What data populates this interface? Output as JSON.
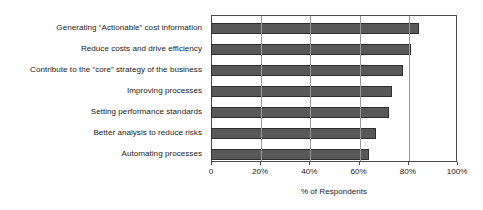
{
  "chart_data": {
    "type": "bar",
    "orientation": "horizontal",
    "title": "",
    "xlabel": "% of Respondents",
    "ylabel": "",
    "xlim": [
      0,
      100
    ],
    "xticks": [
      0,
      20,
      40,
      60,
      80,
      100
    ],
    "xticklabels": [
      "0",
      "20%",
      "40%",
      "60%",
      "80%",
      "100%"
    ],
    "grid": true,
    "legend": null,
    "categories": [
      "Generating “Actionable” cost information",
      "Reduce costs and drive efficiency",
      "Contribute to the “core” strategy of the business",
      "Improving processes",
      "Setting performance standards",
      "Better analysis to reduce risks",
      "Automating processes"
    ],
    "values": [
      84,
      81,
      77.5,
      73,
      72,
      66.5,
      64
    ],
    "bar_color": "#585858",
    "bar_edge_color": "#2e2e2e",
    "plot_border_color": "#4a4a4a",
    "gridline_color": "#9a9a9a",
    "background_color": "#ffffff"
  }
}
